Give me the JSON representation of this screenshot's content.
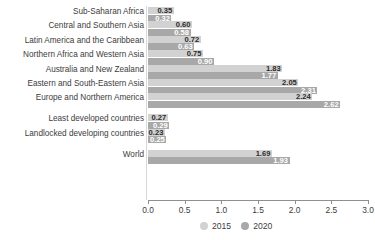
{
  "chart_data": {
    "type": "bar",
    "orientation": "horizontal",
    "title": "",
    "subtitle": "",
    "xlabel": "",
    "ylabel": "",
    "xlim": [
      0.0,
      3.0
    ],
    "xticks": [
      "0.0",
      "0.5",
      "1.0",
      "1.5",
      "2.0",
      "2.5",
      "3.0"
    ],
    "grid": false,
    "legend_position": "bottom-right",
    "categories": [
      "Sub-Saharan Africa",
      "Central and Southern Asia",
      "Latin America and the Caribbean",
      "Northern Africa and Western Asia",
      "Australia and New Zealand",
      "Eastern and South-Eastern Asia",
      "Europe and Northern America",
      "Least developed countries",
      "Landlocked developing countries",
      "World"
    ],
    "series": [
      {
        "name": "2015",
        "color": "#d2d2d2",
        "values": [
          0.35,
          0.6,
          0.72,
          0.75,
          1.83,
          2.05,
          2.24,
          0.27,
          0.23,
          1.69
        ],
        "labels": [
          "0.35",
          "0.60",
          "0.72",
          "0.75",
          "1.83",
          "2.05",
          "2.24",
          "0.27",
          "0.23",
          "1.69"
        ]
      },
      {
        "name": "2020",
        "color": "#a8a8a8",
        "values": [
          0.32,
          0.58,
          0.63,
          0.9,
          1.77,
          2.31,
          2.62,
          0.29,
          0.25,
          1.93
        ],
        "labels": [
          "0.32",
          "0.58",
          "0.63",
          "0.90",
          "1.77",
          "2.31",
          "2.62",
          "0.29",
          "0.25",
          "1.93"
        ]
      }
    ]
  },
  "legend": {
    "items": [
      {
        "label": "2015",
        "color": "#d2d2d2"
      },
      {
        "label": "2020",
        "color": "#a8a8a8"
      }
    ]
  }
}
